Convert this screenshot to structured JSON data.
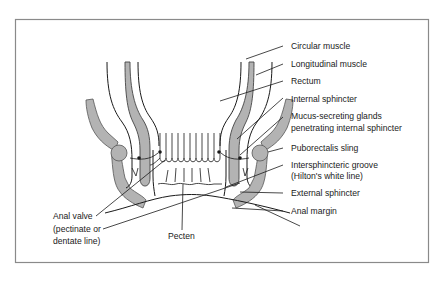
{
  "figure": {
    "frame_color": "#8a8a8a",
    "muscle_fill": "#b3b3b3",
    "line_color": "#1a1a1a"
  },
  "labels": {
    "right": [
      {
        "id": "circular-muscle",
        "text": "Circular muscle"
      },
      {
        "id": "longitudinal-muscle",
        "text": "Longitudinal muscle"
      },
      {
        "id": "rectum",
        "text": "Rectum"
      },
      {
        "id": "internal-sphincter",
        "text": "Internal sphincter"
      },
      {
        "id": "mucus-glands-1",
        "text": "Mucus-secreting glands"
      },
      {
        "id": "mucus-glands-2",
        "text": "penetrating internal sphincter"
      },
      {
        "id": "puborectalis-sling",
        "text": "Puborectalis sling"
      },
      {
        "id": "intersphincteric-groove-1",
        "text": "Intersphincteric groove"
      },
      {
        "id": "intersphincteric-groove-2",
        "text": "(Hilton's white line)"
      },
      {
        "id": "external-sphincter",
        "text": "External sphincter"
      },
      {
        "id": "anal-margin",
        "text": "Anal margin"
      }
    ],
    "left": [
      {
        "id": "anal-valve-1",
        "text": "Anal valve"
      },
      {
        "id": "anal-valve-2",
        "text": "(pectinate or"
      },
      {
        "id": "anal-valve-3",
        "text": "dentate line)"
      }
    ],
    "bottom": [
      {
        "id": "pecten",
        "text": "Pecten"
      }
    ]
  }
}
